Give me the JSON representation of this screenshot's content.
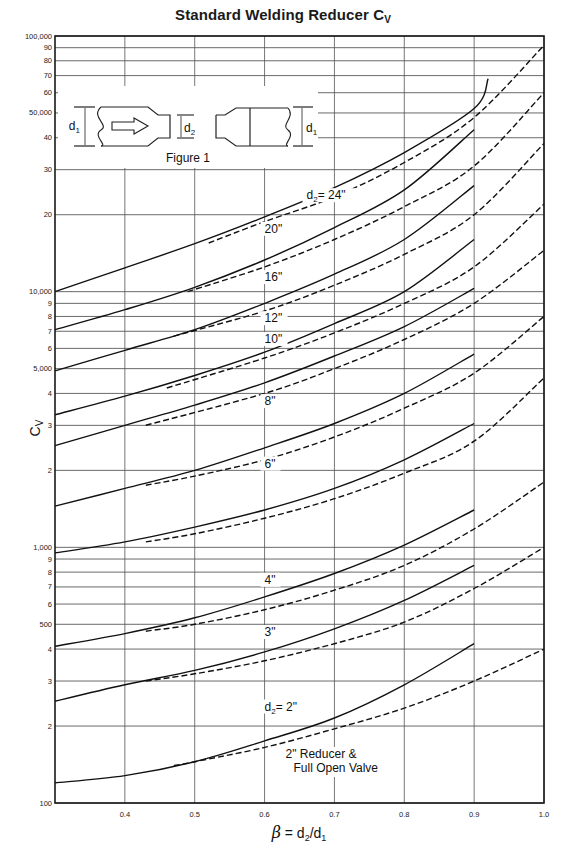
{
  "title": "Standard Welding Reducer Cv",
  "title_main": "Standard Welding Reducer C",
  "title_sub": "V",
  "figure": {
    "caption": "Figure 1",
    "labels": [
      "d1",
      "d2",
      "d1"
    ]
  },
  "chart_data": {
    "type": "line",
    "title": "Standard Welding Reducer Cv",
    "xlabel": "β = d2/d1",
    "ylabel": "Cv",
    "xscale": "linear",
    "yscale": "log",
    "xlim": [
      0.3,
      1.0
    ],
    "ylim": [
      100,
      100000
    ],
    "grid": true,
    "x_ticks": [
      "0.4",
      "0.5",
      "0.6",
      "0.7",
      "0.8",
      "0.9",
      "1.0"
    ],
    "y_ticks": [
      {
        "value": 100,
        "label": "100"
      },
      {
        "value": 200,
        "label": "2"
      },
      {
        "value": 300,
        "label": "3"
      },
      {
        "value": 400,
        "label": "4"
      },
      {
        "value": 500,
        "label": "500"
      },
      {
        "value": 600,
        "label": "6"
      },
      {
        "value": 700,
        "label": "7"
      },
      {
        "value": 800,
        "label": "8"
      },
      {
        "value": 900,
        "label": "9"
      },
      {
        "value": 1000,
        "label": "1,000"
      },
      {
        "value": 2000,
        "label": "2"
      },
      {
        "value": 3000,
        "label": "3"
      },
      {
        "value": 4000,
        "label": "4"
      },
      {
        "value": 5000,
        "label": "5,000"
      },
      {
        "value": 6000,
        "label": "6"
      },
      {
        "value": 7000,
        "label": "7"
      },
      {
        "value": 8000,
        "label": "8"
      },
      {
        "value": 9000,
        "label": "9"
      },
      {
        "value": 10000,
        "label": "10,000"
      },
      {
        "value": 20000,
        "label": "20"
      },
      {
        "value": 30000,
        "label": "30"
      },
      {
        "value": 40000,
        "label": "40"
      },
      {
        "value": 50000,
        "label": "50,000"
      },
      {
        "value": 60000,
        "label": "60"
      },
      {
        "value": 70000,
        "label": "70"
      },
      {
        "value": 80000,
        "label": "80"
      },
      {
        "value": 90000,
        "label": "90"
      },
      {
        "value": 100000,
        "label": "100,000"
      }
    ],
    "series": [
      {
        "name": "d2 = 24\" (reducer)",
        "style": "solid",
        "x": [
          0.3,
          0.4,
          0.5,
          0.6,
          0.7,
          0.8,
          0.9,
          0.92
        ],
        "y": [
          10000,
          12400,
          15400,
          19600,
          25500,
          35000,
          52000,
          68000
        ]
      },
      {
        "name": "d2 = 24\" (reducer & full open valve)",
        "style": "dashed",
        "x": [
          0.52,
          0.6,
          0.7,
          0.8,
          0.9,
          1.0
        ],
        "y": [
          15500,
          18800,
          23500,
          32000,
          48000,
          92000
        ]
      },
      {
        "name": "d2 = 20\" (reducer)",
        "style": "solid",
        "x": [
          0.3,
          0.4,
          0.5,
          0.6,
          0.7,
          0.8,
          0.9
        ],
        "y": [
          7100,
          8500,
          10400,
          13300,
          17800,
          25000,
          43000
        ]
      },
      {
        "name": "d2 = 20\" (reducer & full open valve)",
        "style": "dashed",
        "x": [
          0.49,
          0.6,
          0.7,
          0.8,
          0.9,
          1.0
        ],
        "y": [
          10000,
          12500,
          16000,
          21500,
          31000,
          60000
        ]
      },
      {
        "name": "d2 = 16\" (reducer)",
        "style": "solid",
        "x": [
          0.3,
          0.4,
          0.5,
          0.6,
          0.7,
          0.8,
          0.9
        ],
        "y": [
          4900,
          5900,
          7100,
          9000,
          11700,
          16000,
          26000
        ]
      },
      {
        "name": "d2 = 16\" (reducer & full open valve)",
        "style": "dashed",
        "x": [
          0.47,
          0.6,
          0.7,
          0.8,
          0.9,
          1.0
        ],
        "y": [
          6700,
          8400,
          10600,
          14000,
          20000,
          38000
        ]
      },
      {
        "name": "d2 = 12\" (reducer)",
        "style": "solid",
        "x": [
          0.3,
          0.4,
          0.5,
          0.6,
          0.7,
          0.8,
          0.9
        ],
        "y": [
          3300,
          3900,
          4700,
          5800,
          7500,
          10000,
          16000
        ]
      },
      {
        "name": "d2 = 12\" (reducer & full open valve)",
        "style": "dashed",
        "x": [
          0.46,
          0.6,
          0.7,
          0.8,
          0.9,
          1.0
        ],
        "y": [
          4200,
          5500,
          6900,
          9000,
          12500,
          22000
        ]
      },
      {
        "name": "d2 = 10\" (reducer)",
        "style": "solid",
        "x": [
          0.3,
          0.4,
          0.5,
          0.6,
          0.7,
          0.8,
          0.9
        ],
        "y": [
          2500,
          3000,
          3600,
          4400,
          5600,
          7300,
          10300
        ]
      },
      {
        "name": "d2 = 10\" (reducer & full open valve)",
        "style": "dashed",
        "x": [
          0.43,
          0.6,
          0.7,
          0.8,
          0.9,
          1.0
        ],
        "y": [
          3000,
          4000,
          5000,
          6500,
          9000,
          14500
        ]
      },
      {
        "name": "d2 = 8\" (reducer)",
        "style": "solid",
        "x": [
          0.3,
          0.4,
          0.5,
          0.6,
          0.7,
          0.8,
          0.9
        ],
        "y": [
          1450,
          1700,
          2000,
          2450,
          3050,
          4000,
          5700
        ]
      },
      {
        "name": "d2 = 8\" (reducer & full open valve)",
        "style": "dashed",
        "x": [
          0.43,
          0.5,
          0.6,
          0.7,
          0.8,
          0.9,
          1.0
        ],
        "y": [
          1750,
          1900,
          2200,
          2700,
          3500,
          4800,
          8000
        ]
      },
      {
        "name": "d2 = 6\" (reducer)",
        "style": "solid",
        "x": [
          0.3,
          0.4,
          0.5,
          0.6,
          0.7,
          0.8,
          0.9
        ],
        "y": [
          950,
          1050,
          1200,
          1400,
          1700,
          2200,
          3050
        ]
      },
      {
        "name": "d2 = 6\" (reducer & full open valve)",
        "style": "dashed",
        "x": [
          0.43,
          0.5,
          0.6,
          0.7,
          0.8,
          0.9,
          1.0
        ],
        "y": [
          1050,
          1130,
          1300,
          1550,
          1950,
          2600,
          4600
        ]
      },
      {
        "name": "d2 = 4\" (reducer)",
        "style": "solid",
        "x": [
          0.3,
          0.4,
          0.5,
          0.6,
          0.7,
          0.8,
          0.9
        ],
        "y": [
          410,
          460,
          530,
          640,
          790,
          1020,
          1400
        ]
      },
      {
        "name": "d2 = 4\" (reducer & full open valve)",
        "style": "dashed",
        "x": [
          0.43,
          0.5,
          0.6,
          0.7,
          0.8,
          0.9,
          1.0
        ],
        "y": [
          470,
          500,
          570,
          680,
          850,
          1180,
          1800
        ]
      },
      {
        "name": "d2 = 3\" (reducer)",
        "style": "solid",
        "x": [
          0.3,
          0.4,
          0.5,
          0.6,
          0.7,
          0.8,
          0.9
        ],
        "y": [
          250,
          290,
          330,
          390,
          480,
          620,
          850
        ]
      },
      {
        "name": "d2 = 3\" (reducer & full open valve)",
        "style": "dashed",
        "x": [
          0.43,
          0.5,
          0.6,
          0.7,
          0.8,
          0.9,
          1.0
        ],
        "y": [
          300,
          320,
          360,
          420,
          510,
          690,
          1000
        ]
      },
      {
        "name": "d2 = 2\" (reducer)",
        "style": "solid",
        "x": [
          0.3,
          0.4,
          0.5,
          0.6,
          0.7,
          0.8,
          0.9
        ],
        "y": [
          120,
          128,
          145,
          175,
          215,
          290,
          420
        ]
      },
      {
        "name": "2\" Reducer & Full Open Valve",
        "style": "dashed",
        "x": [
          0.47,
          0.5,
          0.6,
          0.7,
          0.8,
          0.9,
          1.0
        ],
        "y": [
          140,
          145,
          165,
          195,
          235,
          300,
          400
        ]
      }
    ],
    "annotations": [
      {
        "text": "d2= 24\"",
        "x": 0.66,
        "y": 23000
      },
      {
        "text": "20\"",
        "x": 0.6,
        "y": 17000
      },
      {
        "text": "16\"",
        "x": 0.6,
        "y": 11000
      },
      {
        "text": "12\"",
        "x": 0.6,
        "y": 7600
      },
      {
        "text": "10\"",
        "x": 0.6,
        "y": 6300
      },
      {
        "text": "8\"",
        "x": 0.6,
        "y": 3600
      },
      {
        "text": "6\"",
        "x": 0.6,
        "y": 2050
      },
      {
        "text": "4\"",
        "x": 0.6,
        "y": 720
      },
      {
        "text": "3\"",
        "x": 0.6,
        "y": 450
      },
      {
        "text": "d2= 2\"",
        "x": 0.6,
        "y": 230
      },
      {
        "text": "2\" Reducer & Full Open Valve",
        "x": 0.63,
        "y": 150
      }
    ]
  }
}
